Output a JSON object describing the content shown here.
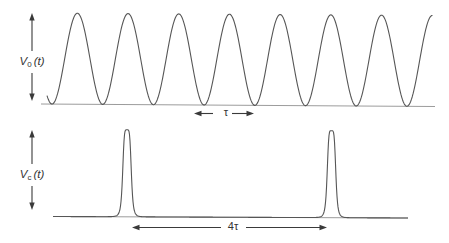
{
  "colors": {
    "background": "#ffffff",
    "curve": "#565656",
    "baseline": "#9c9c9c",
    "ink": "#3a3a3a"
  },
  "panels": {
    "top": {
      "label": {
        "base": "V",
        "sub": "0",
        "arg": "(t)"
      },
      "annotation": {
        "text": "τ"
      }
    },
    "bottom": {
      "label": {
        "base": "V",
        "sub": "c",
        "arg": "(t)"
      },
      "annotation": {
        "text": "4τ"
      }
    }
  },
  "chart_data": [
    {
      "id": "v0_waveform",
      "type": "line",
      "title": "V0(t): continuous sinusoid, period τ",
      "xlabel": "t (no ticks shown)",
      "ylabel": "amplitude (peak-to-peak marked by double arrow)",
      "cycles_shown": 8,
      "grid": false,
      "geometry_px": {
        "x_start": 47,
        "x_end": 433,
        "first_min_x": 52,
        "period": 50.7,
        "amplitude": 91,
        "baseline": {
          "x1": 41,
          "y1": 104.0,
          "x2": 435,
          "y2": 106.5
        }
      }
    },
    {
      "id": "vc_waveform",
      "type": "line",
      "title": "Vc(t): narrow pulse train, pulses separated by 4τ",
      "xlabel": "t (no ticks shown)",
      "ylabel": "amplitude (pulse height marked by double arrow)",
      "pulses_shown": 2,
      "grid": false,
      "geometry_px": {
        "x_start": 53,
        "x_end": 408,
        "centers": [
          127,
          331.5
        ],
        "height": 87,
        "half_width": 4.4,
        "shape_power": 5,
        "baseline": {
          "x1": 53,
          "y1": 216.5,
          "x2": 408,
          "y2": 218.0
        }
      }
    }
  ],
  "annotations_geometry": {
    "top_arrow": {
      "x": 32,
      "tip_top": 13,
      "tip_bottom": 101,
      "gap_top": 51,
      "gap_bottom": 73
    },
    "bottom_arrow": {
      "x": 32,
      "tip_top": 130,
      "tip_bottom": 210,
      "gap_top": 164,
      "gap_bottom": 186
    },
    "tau": {
      "y": 113.5,
      "left_tip": 194,
      "left_tail": 213,
      "right_tail": 232,
      "right_tip": 254,
      "text_x": 226,
      "text_y": 113
    },
    "fourtau": {
      "y": 227.5,
      "left_tip": 132,
      "left_tail": 221,
      "right_tail": 246,
      "right_tip": 327,
      "text_x": 233,
      "text_y": 226.5
    }
  }
}
